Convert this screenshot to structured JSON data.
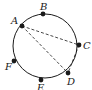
{
  "diagram": {
    "type": "circle-with-points",
    "circle": {
      "cx": 45,
      "cy": 46,
      "r": 32,
      "stroke": "#1a1a1a"
    },
    "points": [
      {
        "id": "A",
        "label": "A",
        "x": 22,
        "y": 26,
        "lx": 11,
        "ly": 24
      },
      {
        "id": "B",
        "label": "B",
        "x": 43,
        "y": 14,
        "lx": 40,
        "ly": 10
      },
      {
        "id": "C",
        "label": "C",
        "x": 79,
        "y": 45,
        "lx": 83,
        "ly": 49
      },
      {
        "id": "D",
        "label": "D",
        "x": 68,
        "y": 73,
        "lx": 67,
        "ly": 85
      },
      {
        "id": "E",
        "label": "E",
        "x": 41,
        "y": 80,
        "lx": 37,
        "ly": 91
      },
      {
        "id": "F",
        "label": "F",
        "x": 14,
        "y": 61,
        "lx": 5,
        "ly": 70
      }
    ],
    "dashed_segments": [
      {
        "from": "A",
        "to": "C"
      },
      {
        "from": "A",
        "to": "D"
      },
      {
        "from": "C",
        "to": "D"
      }
    ],
    "colors": {
      "ink": "#1a1a1a",
      "background": "#ffffff"
    }
  }
}
